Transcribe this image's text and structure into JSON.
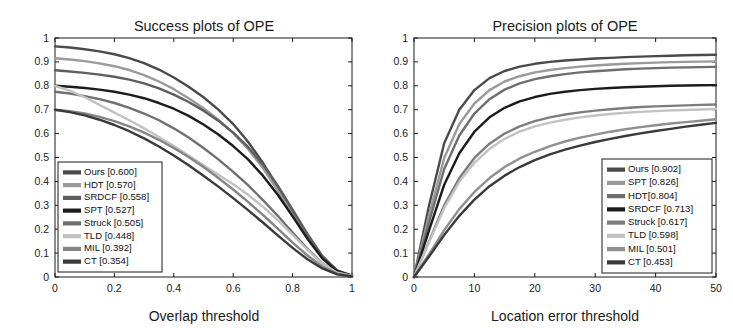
{
  "figure": {
    "background": "#ffffff",
    "panels": [
      "success",
      "precision"
    ]
  },
  "chart_data": [
    {
      "id": "success",
      "type": "line",
      "title": "Success plots of OPE",
      "xlabel": "Overlap threshold",
      "ylabel": "",
      "xlim": [
        0,
        1
      ],
      "ylim": [
        0,
        1
      ],
      "grid": false,
      "legend_position": "lower-left",
      "xticks": [
        "0",
        "0.2",
        "0.4",
        "0.6",
        "0.8",
        "1"
      ],
      "xtick_values": [
        0,
        0.2,
        0.4,
        0.6,
        0.8,
        1
      ],
      "yticks": [
        "0",
        "0.1",
        "0.2",
        "0.3",
        "0.4",
        "0.5",
        "0.6",
        "0.7",
        "0.8",
        "0.9",
        "1"
      ],
      "ytick_values": [
        0,
        0.1,
        0.2,
        0.3,
        0.4,
        0.5,
        0.6,
        0.7,
        0.8,
        0.9,
        1
      ],
      "x": [
        0,
        0.05,
        0.1,
        0.15,
        0.2,
        0.25,
        0.3,
        0.35,
        0.4,
        0.45,
        0.5,
        0.55,
        0.6,
        0.65,
        0.7,
        0.75,
        0.8,
        0.85,
        0.9,
        0.95,
        1
      ],
      "series": [
        {
          "name": "Ours",
          "score": "0.600",
          "legend_label": "Ours [0.600]",
          "color": "#4a4a4a",
          "values": [
            0.965,
            0.96,
            0.953,
            0.944,
            0.932,
            0.916,
            0.895,
            0.868,
            0.835,
            0.796,
            0.752,
            0.7,
            0.64,
            0.566,
            0.478,
            0.378,
            0.272,
            0.17,
            0.082,
            0.026,
            0.006
          ]
        },
        {
          "name": "HDT",
          "score": "0.570",
          "legend_label": "HDT [0.570]",
          "color": "#9a9a9a",
          "values": [
            0.915,
            0.91,
            0.903,
            0.894,
            0.882,
            0.866,
            0.845,
            0.818,
            0.786,
            0.748,
            0.706,
            0.658,
            0.602,
            0.536,
            0.456,
            0.362,
            0.262,
            0.164,
            0.08,
            0.025,
            0.006
          ]
        },
        {
          "name": "SRDCF",
          "score": "0.558",
          "legend_label": "SRDCF [0.558]",
          "color": "#5e5e5e",
          "values": [
            0.865,
            0.86,
            0.854,
            0.847,
            0.838,
            0.826,
            0.81,
            0.789,
            0.763,
            0.732,
            0.696,
            0.654,
            0.604,
            0.544,
            0.47,
            0.382,
            0.282,
            0.18,
            0.088,
            0.028,
            0.006
          ]
        },
        {
          "name": "SPT",
          "score": "0.527",
          "legend_label": "SPT [0.527]",
          "color": "#1c1c1c",
          "values": [
            0.8,
            0.796,
            0.791,
            0.784,
            0.775,
            0.763,
            0.748,
            0.728,
            0.704,
            0.674,
            0.638,
            0.596,
            0.548,
            0.492,
            0.424,
            0.344,
            0.254,
            0.16,
            0.078,
            0.024,
            0.005
          ]
        },
        {
          "name": "Struck",
          "score": "0.505",
          "legend_label": "Struck [0.505]",
          "color": "#707070",
          "values": [
            0.775,
            0.768,
            0.757,
            0.744,
            0.728,
            0.708,
            0.684,
            0.656,
            0.622,
            0.584,
            0.54,
            0.492,
            0.44,
            0.384,
            0.322,
            0.256,
            0.186,
            0.118,
            0.058,
            0.018,
            0.004
          ]
        },
        {
          "name": "TLD",
          "score": "0.448",
          "legend_label": "TLD [0.448]",
          "color": "#c2c2c2",
          "values": [
            0.8,
            0.78,
            0.752,
            0.72,
            0.688,
            0.656,
            0.622,
            0.586,
            0.548,
            0.508,
            0.468,
            0.428,
            0.388,
            0.344,
            0.294,
            0.238,
            0.176,
            0.114,
            0.056,
            0.018,
            0.004
          ]
        },
        {
          "name": "MIL",
          "score": "0.392",
          "legend_label": "MIL [0.392]",
          "color": "#858585",
          "values": [
            0.7,
            0.694,
            0.684,
            0.67,
            0.652,
            0.63,
            0.604,
            0.574,
            0.54,
            0.502,
            0.46,
            0.414,
            0.366,
            0.314,
            0.26,
            0.202,
            0.144,
            0.09,
            0.044,
            0.014,
            0.003
          ]
        },
        {
          "name": "CT",
          "score": "0.354",
          "legend_label": "CT [0.354]",
          "color": "#3a3a3a",
          "values": [
            0.7,
            0.69,
            0.676,
            0.658,
            0.636,
            0.61,
            0.58,
            0.546,
            0.508,
            0.468,
            0.424,
            0.378,
            0.33,
            0.28,
            0.228,
            0.174,
            0.122,
            0.074,
            0.036,
            0.011,
            0.002
          ]
        }
      ]
    },
    {
      "id": "precision",
      "type": "line",
      "title": "Precision plots of OPE",
      "xlabel": "Location error threshold",
      "ylabel": "",
      "xlim": [
        0,
        50
      ],
      "ylim": [
        0,
        1
      ],
      "grid": false,
      "legend_position": "lower-right",
      "xticks": [
        "0",
        "10",
        "20",
        "30",
        "40",
        "50"
      ],
      "xtick_values": [
        0,
        10,
        20,
        30,
        40,
        50
      ],
      "yticks": [
        "0",
        "0.1",
        "0.2",
        "0.3",
        "0.4",
        "0.5",
        "0.6",
        "0.7",
        "0.8",
        "0.9",
        "1"
      ],
      "ytick_values": [
        0,
        0.1,
        0.2,
        0.3,
        0.4,
        0.5,
        0.6,
        0.7,
        0.8,
        0.9,
        1
      ],
      "x": [
        0,
        2.5,
        5,
        7.5,
        10,
        12.5,
        15,
        17.5,
        20,
        22.5,
        25,
        27.5,
        30,
        32.5,
        35,
        37.5,
        40,
        42.5,
        45,
        47.5,
        50
      ],
      "series": [
        {
          "name": "Ours",
          "score": "0.902",
          "legend_label": "Ours [0.902]",
          "color": "#4a4a4a",
          "values": [
            0.0,
            0.3,
            0.56,
            0.7,
            0.782,
            0.832,
            0.862,
            0.88,
            0.892,
            0.9,
            0.906,
            0.91,
            0.914,
            0.917,
            0.92,
            0.922,
            0.924,
            0.926,
            0.928,
            0.929,
            0.93
          ]
        },
        {
          "name": "SPT",
          "score": "0.826",
          "legend_label": "SPT [0.826]",
          "color": "#9a9a9a",
          "values": [
            0.0,
            0.26,
            0.498,
            0.64,
            0.726,
            0.782,
            0.818,
            0.84,
            0.856,
            0.866,
            0.874,
            0.88,
            0.885,
            0.889,
            0.892,
            0.895,
            0.897,
            0.899,
            0.9,
            0.901,
            0.902
          ]
        },
        {
          "name": "HDT",
          "score": "0.804",
          "legend_label": "HDT[0.804]",
          "color": "#6e6e6e",
          "values": [
            0.0,
            0.23,
            0.452,
            0.592,
            0.684,
            0.744,
            0.784,
            0.81,
            0.828,
            0.84,
            0.849,
            0.856,
            0.861,
            0.865,
            0.869,
            0.872,
            0.874,
            0.876,
            0.877,
            0.878,
            0.879
          ]
        },
        {
          "name": "SRDCF",
          "score": "0.713",
          "legend_label": "SRDCF [0.713]",
          "color": "#1c1c1c",
          "values": [
            0.0,
            0.196,
            0.386,
            0.518,
            0.608,
            0.668,
            0.708,
            0.735,
            0.753,
            0.766,
            0.775,
            0.782,
            0.787,
            0.791,
            0.794,
            0.796,
            0.798,
            0.8,
            0.801,
            0.802,
            0.803
          ]
        },
        {
          "name": "Struck",
          "score": "0.617",
          "legend_label": "Struck [0.617]",
          "color": "#7d7d7d",
          "values": [
            0.0,
            0.15,
            0.3,
            0.414,
            0.498,
            0.558,
            0.6,
            0.63,
            0.652,
            0.668,
            0.68,
            0.689,
            0.696,
            0.702,
            0.707,
            0.711,
            0.714,
            0.716,
            0.718,
            0.72,
            0.722
          ]
        },
        {
          "name": "TLD",
          "score": "0.598",
          "legend_label": "TLD [0.598]",
          "color": "#c2c2c2",
          "values": [
            0.0,
            0.146,
            0.288,
            0.398,
            0.478,
            0.536,
            0.578,
            0.608,
            0.63,
            0.646,
            0.658,
            0.668,
            0.676,
            0.682,
            0.687,
            0.691,
            0.694,
            0.697,
            0.699,
            0.701,
            0.703
          ]
        },
        {
          "name": "MIL",
          "score": "0.501",
          "legend_label": "MIL [0.501]",
          "color": "#8f8f8f",
          "values": [
            0.0,
            0.096,
            0.196,
            0.284,
            0.356,
            0.414,
            0.46,
            0.496,
            0.524,
            0.548,
            0.567,
            0.583,
            0.596,
            0.608,
            0.618,
            0.627,
            0.635,
            0.642,
            0.648,
            0.654,
            0.66
          ]
        },
        {
          "name": "CT",
          "score": "0.453",
          "legend_label": "CT [0.453]",
          "color": "#3a3a3a",
          "values": [
            0.0,
            0.086,
            0.176,
            0.256,
            0.324,
            0.38,
            0.424,
            0.46,
            0.489,
            0.513,
            0.533,
            0.55,
            0.565,
            0.578,
            0.59,
            0.601,
            0.611,
            0.62,
            0.629,
            0.637,
            0.645
          ]
        }
      ]
    }
  ]
}
